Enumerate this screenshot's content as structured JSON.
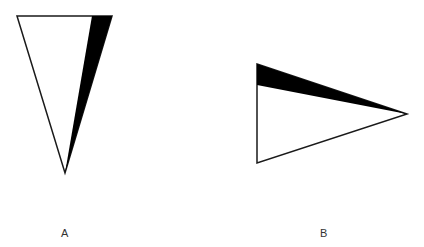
{
  "figures": [
    {
      "id": "A",
      "label": "A",
      "shape": "inverted-triangle",
      "outline_vertices": [
        [
          17,
          16
        ],
        [
          112,
          16
        ],
        [
          65,
          173
        ]
      ],
      "shaded_region": [
        [
          92,
          16
        ],
        [
          112,
          16
        ],
        [
          65,
          173
        ]
      ],
      "fill_color": "#ffffff",
      "shade_color": "#000000",
      "stroke_color": "#1a1a1a"
    },
    {
      "id": "B",
      "label": "B",
      "shape": "right-pointing-triangle",
      "outline_vertices": [
        [
          257,
          64
        ],
        [
          407,
          114
        ],
        [
          257,
          163
        ]
      ],
      "shaded_region": [
        [
          257,
          64
        ],
        [
          407,
          114
        ],
        [
          257,
          85
        ]
      ],
      "fill_color": "#ffffff",
      "shade_color": "#000000",
      "stroke_color": "#1a1a1a"
    }
  ],
  "labels": {
    "a": "A",
    "b": "B"
  }
}
